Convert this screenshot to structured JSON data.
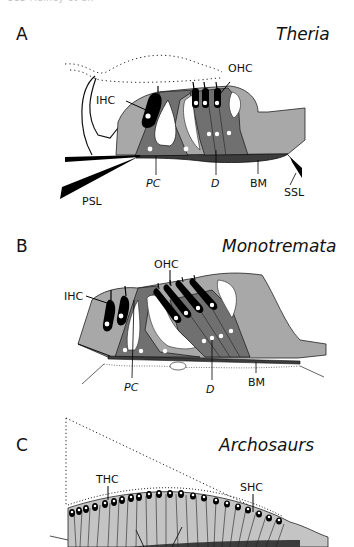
{
  "page_header": "312  Manley et al.",
  "colors": {
    "light_gray": "#a8a8a8",
    "medium_gray": "#707070",
    "dark_gray": "#3c3c3c",
    "black": "#000000",
    "background": "#ffffff"
  },
  "panels": [
    {
      "letter": "A",
      "title": "Theria",
      "labels": {
        "ihc": "IHC",
        "ohc": "OHC",
        "pc": "PC",
        "d": "D",
        "bm": "BM",
        "psl": "PSL",
        "ssl": "SSL"
      }
    },
    {
      "letter": "B",
      "title": "Monotremata",
      "labels": {
        "ihc": "IHC",
        "ohc": "OHC",
        "pc": "PC",
        "d": "D",
        "bm": "BM"
      }
    },
    {
      "letter": "C",
      "title": "Archosaurs",
      "labels": {
        "thc": "THC",
        "shc": "SHC"
      }
    }
  ]
}
